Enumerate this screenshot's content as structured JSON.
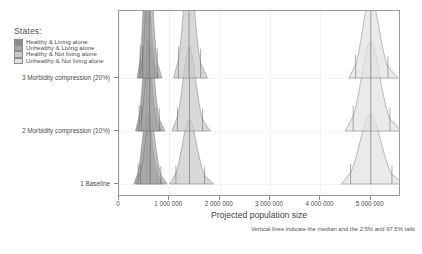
{
  "legend": {
    "title": "States:",
    "items": [
      {
        "label": "Healthy & Living alone",
        "color": "#8c8c8c"
      },
      {
        "label": "Unhealthy & Living alone",
        "color": "#a8a8a8"
      },
      {
        "label": "Healthy & Not living alone",
        "color": "#c9c9c9"
      },
      {
        "label": "Unhealthy & Not living alone",
        "color": "#e2e2e2"
      }
    ]
  },
  "axes": {
    "xtitle": "Projected population size",
    "footnote": "Vertical lines indicate the median and the 2.5% and 97.5% tails",
    "xticklabels": [
      "0",
      "1 000 000",
      "2 000 000",
      "3 000 000",
      "4 000 000",
      "5 000 000"
    ],
    "xtickvalues": [
      0,
      1000000,
      2000000,
      3000000,
      4000000,
      5000000
    ],
    "yticklabels": [
      "1 Baseline",
      "2 Morbidity compression (10%)",
      "3 Morbidity compression (20%)"
    ]
  },
  "chart_data": {
    "type": "area",
    "title": "",
    "subtitle": "",
    "xlabel": "Projected population size",
    "ylabel": "",
    "xlim": [
      0,
      5600000
    ],
    "grid": true,
    "legend_position": "top-left-outside",
    "annotations": [
      "Vertical lines indicate the median and the 2.5% and 97.5% tails"
    ],
    "rows": [
      {
        "name": "1 Baseline",
        "series": [
          {
            "name": "Healthy & Living alone",
            "median": 560000,
            "lo": 380000,
            "hi": 760000,
            "peak_height": 0.62
          },
          {
            "name": "Unhealthy & Living alone",
            "median": 620000,
            "lo": 430000,
            "hi": 830000,
            "peak_height": 0.58
          },
          {
            "name": "Healthy & Not living alone",
            "median": 1400000,
            "lo": 1130000,
            "hi": 1700000,
            "peak_height": 0.55
          },
          {
            "name": "Unhealthy & Not living alone",
            "median": 5000000,
            "lo": 4600000,
            "hi": 5420000,
            "peak_height": 0.6
          }
        ]
      },
      {
        "name": "2 Morbidity compression (10%)",
        "series": [
          {
            "name": "Healthy & Living alone",
            "median": 560000,
            "lo": 400000,
            "hi": 740000,
            "peak_height": 0.78
          },
          {
            "name": "Unhealthy & Living alone",
            "median": 610000,
            "lo": 450000,
            "hi": 800000,
            "peak_height": 0.74
          },
          {
            "name": "Healthy & Not living alone",
            "median": 1400000,
            "lo": 1160000,
            "hi": 1660000,
            "peak_height": 0.72
          },
          {
            "name": "Unhealthy & Not living alone",
            "median": 5000000,
            "lo": 4650000,
            "hi": 5380000,
            "peak_height": 0.76
          }
        ]
      },
      {
        "name": "3 Morbidity compression (20%)",
        "series": [
          {
            "name": "Healthy & Living alone",
            "median": 550000,
            "lo": 420000,
            "hi": 700000,
            "peak_height": 1.0
          },
          {
            "name": "Unhealthy & Living alone",
            "median": 600000,
            "lo": 470000,
            "hi": 760000,
            "peak_height": 0.97
          },
          {
            "name": "Healthy & Not living alone",
            "median": 1390000,
            "lo": 1180000,
            "hi": 1620000,
            "peak_height": 0.95
          },
          {
            "name": "Unhealthy & Not living alone",
            "median": 5000000,
            "lo": 4700000,
            "hi": 5340000,
            "peak_height": 0.7
          }
        ]
      }
    ]
  }
}
